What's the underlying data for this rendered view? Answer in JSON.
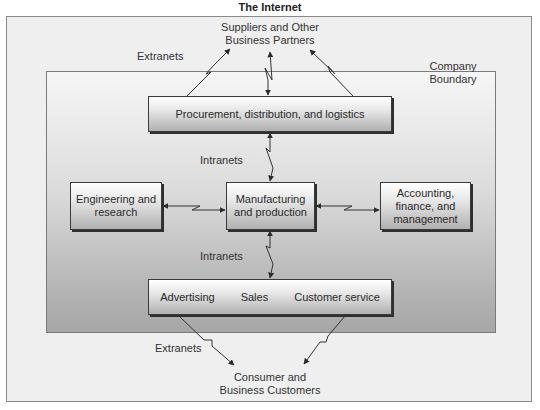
{
  "diagram": {
    "title": "The Internet",
    "nodes": {
      "suppliers": {
        "line1": "Suppliers and Other",
        "line2": "Business Partners"
      },
      "company_boundary": {
        "line1": "Company",
        "line2": "Boundary"
      },
      "procurement": {
        "label": "Procurement, distribution, and logistics"
      },
      "engineering": {
        "line1": "Engineering and",
        "line2": "research"
      },
      "manufacturing": {
        "line1": "Manufacturing",
        "line2": "and production"
      },
      "accounting": {
        "line1": "Accounting,",
        "line2": "finance, and",
        "line3": "management"
      },
      "customer_facing": {
        "items": [
          "Advertising",
          "Sales",
          "Customer service"
        ]
      },
      "customers": {
        "line1": "Consumer and",
        "line2": "Business Customers"
      }
    },
    "connection_labels": {
      "extranets_top": "Extranets",
      "intranets_top": "Intranets",
      "intranets_bottom": "Intranets",
      "extranets_bottom": "Extranets"
    },
    "edges": [
      {
        "from": "procurement",
        "to": "suppliers",
        "type": "Extranets"
      },
      {
        "from": "procurement",
        "to": "suppliers",
        "type": "bidirectional"
      },
      {
        "from": "procurement",
        "to": "suppliers",
        "type": "Extranets"
      },
      {
        "from": "procurement",
        "to": "manufacturing",
        "type": "Intranets"
      },
      {
        "from": "engineering",
        "to": "manufacturing",
        "type": "bidirectional"
      },
      {
        "from": "manufacturing",
        "to": "accounting",
        "type": "bidirectional"
      },
      {
        "from": "manufacturing",
        "to": "customer_facing",
        "type": "Intranets"
      },
      {
        "from": "customer_facing",
        "to": "customers",
        "type": "Extranets"
      },
      {
        "from": "customer_facing",
        "to": "customers",
        "type": "Extranets"
      }
    ],
    "colors": {
      "box_border": "#3a3a3a",
      "boundary_fill_bottom": "#a6a6a6",
      "outer_fill": "#efefef",
      "line": "#333333"
    }
  }
}
